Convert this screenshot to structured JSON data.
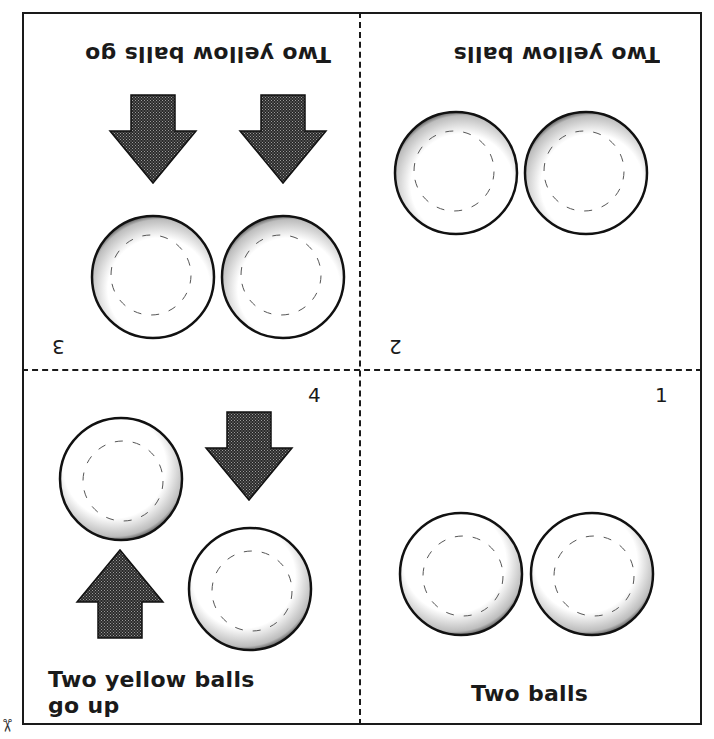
{
  "worksheet": {
    "panels": [
      {
        "number": "1",
        "caption": "Two balls",
        "orientation": "upright",
        "balls": 2,
        "arrows": []
      },
      {
        "number": "2",
        "caption": "Two yellow balls",
        "orientation": "upside-down",
        "balls": 2,
        "arrows": []
      },
      {
        "number": "3",
        "caption": "Two yellow balls go",
        "orientation": "upside-down",
        "balls": 2,
        "arrows": [
          "down",
          "down"
        ]
      },
      {
        "number": "4",
        "caption_line1": "Two yellow balls",
        "caption_line2": "go up",
        "orientation": "upright",
        "balls": 2,
        "arrows": [
          "down",
          "up"
        ]
      }
    ],
    "cut_mark": "✂"
  },
  "colors": {
    "ink": "#1a1a1a",
    "paper": "#ffffff"
  }
}
